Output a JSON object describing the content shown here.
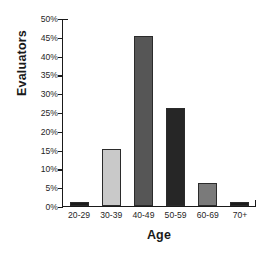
{
  "chart_data": {
    "type": "bar",
    "title": "",
    "xlabel": "Age",
    "ylabel": "Evaluators",
    "categories": [
      "20-29",
      "30-39",
      "40-49",
      "50-59",
      "60-69",
      "70+"
    ],
    "values": [
      1,
      15,
      45,
      26,
      6,
      1
    ],
    "value_format": "percent",
    "ylim": [
      0,
      50
    ],
    "yticks": [
      0,
      5,
      10,
      15,
      20,
      25,
      30,
      35,
      40,
      45,
      50
    ],
    "ytick_labels": [
      "0%",
      "5%",
      "10%",
      "15%",
      "20%",
      "25%",
      "30%",
      "35%",
      "40%",
      "45%",
      "50%"
    ],
    "grid": false,
    "legend": false,
    "bar_colors": [
      "#1c1c1c",
      "#c9c9c9",
      "#565656",
      "#262626",
      "#7a7a7a",
      "#1c1c1c"
    ],
    "bar_outline_color": "#2b2b2b",
    "axis_color": "#1a1a1a",
    "background_color": "#ffffff"
  }
}
